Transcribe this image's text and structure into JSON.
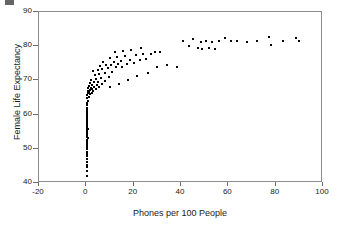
{
  "chart_data": {
    "type": "scatter",
    "title": "",
    "xlabel": "Phones per 100 People",
    "ylabel": "Female Life Expectancy",
    "xlim": [
      -20,
      100
    ],
    "ylim": [
      40,
      90
    ],
    "xticks": [
      -20,
      0,
      20,
      40,
      60,
      80,
      100
    ],
    "yticks": [
      40,
      50,
      60,
      70,
      80,
      90
    ],
    "grid": false,
    "legend": null,
    "marker": "filled-square",
    "marker_color": "#000000",
    "series": [
      {
        "name": "Countries",
        "points": [
          [
            0.2,
            42.0
          ],
          [
            0.3,
            43.5
          ],
          [
            0.2,
            44.6
          ],
          [
            0.4,
            45.4
          ],
          [
            0.2,
            46.2
          ],
          [
            0.3,
            47.0
          ],
          [
            0.2,
            47.8
          ],
          [
            0.4,
            48.5
          ],
          [
            0.2,
            49.2
          ],
          [
            0.3,
            49.9
          ],
          [
            0.2,
            50.5
          ],
          [
            0.4,
            51.1
          ],
          [
            0.2,
            51.7
          ],
          [
            0.3,
            52.2
          ],
          [
            0.2,
            52.7
          ],
          [
            0.5,
            53.1
          ],
          [
            0.2,
            53.5
          ],
          [
            0.3,
            53.9
          ],
          [
            0.2,
            54.2
          ],
          [
            0.4,
            54.5
          ],
          [
            0.2,
            54.8
          ],
          [
            0.3,
            55.1
          ],
          [
            0.2,
            55.4
          ],
          [
            0.5,
            55.7
          ],
          [
            0.2,
            56.0
          ],
          [
            0.3,
            56.4
          ],
          [
            0.2,
            56.8
          ],
          [
            0.4,
            57.2
          ],
          [
            0.2,
            57.6
          ],
          [
            0.3,
            58.1
          ],
          [
            0.2,
            58.6
          ],
          [
            0.4,
            59.1
          ],
          [
            0.2,
            59.6
          ],
          [
            0.3,
            60.2
          ],
          [
            0.2,
            60.8
          ],
          [
            0.4,
            61.4
          ],
          [
            0.2,
            62.0
          ],
          [
            0.3,
            62.7
          ],
          [
            0.2,
            63.4
          ],
          [
            0.5,
            64.1
          ],
          [
            0.3,
            64.8
          ],
          [
            1.0,
            65.2
          ],
          [
            0.4,
            65.6
          ],
          [
            1.6,
            65.9
          ],
          [
            0.6,
            66.2
          ],
          [
            2.2,
            66.4
          ],
          [
            1.1,
            66.6
          ],
          [
            3.0,
            66.8
          ],
          [
            0.5,
            67.0
          ],
          [
            1.7,
            67.2
          ],
          [
            2.6,
            67.4
          ],
          [
            4.0,
            67.5
          ],
          [
            0.8,
            67.7
          ],
          [
            1.9,
            67.9
          ],
          [
            3.3,
            68.1
          ],
          [
            5.2,
            68.2
          ],
          [
            1.2,
            68.4
          ],
          [
            2.4,
            68.6
          ],
          [
            4.4,
            68.8
          ],
          [
            6.5,
            68.9
          ],
          [
            1.5,
            69.2
          ],
          [
            3.1,
            69.4
          ],
          [
            5.0,
            69.6
          ],
          [
            8.0,
            69.8
          ],
          [
            2.0,
            70.2
          ],
          [
            4.2,
            70.5
          ],
          [
            6.2,
            70.8
          ],
          [
            9.5,
            71.0
          ],
          [
            3.6,
            71.5
          ],
          [
            5.5,
            71.8
          ],
          [
            7.8,
            72.2
          ],
          [
            11.0,
            72.5
          ],
          [
            2.8,
            72.8
          ],
          [
            4.8,
            73.1
          ],
          [
            6.8,
            73.4
          ],
          [
            9.0,
            73.6
          ],
          [
            12.5,
            73.8
          ],
          [
            15.0,
            74.0
          ],
          [
            5.8,
            74.2
          ],
          [
            8.4,
            74.4
          ],
          [
            10.5,
            74.6
          ],
          [
            13.5,
            74.8
          ],
          [
            17.0,
            74.9
          ],
          [
            20.0,
            75.1
          ],
          [
            7.2,
            75.3
          ],
          [
            11.8,
            75.5
          ],
          [
            14.5,
            75.7
          ],
          [
            18.5,
            75.9
          ],
          [
            22.5,
            76.1
          ],
          [
            25.0,
            76.3
          ],
          [
            9.8,
            76.5
          ],
          [
            13.0,
            76.8
          ],
          [
            16.5,
            77.0
          ],
          [
            21.0,
            77.3
          ],
          [
            24.0,
            77.6
          ],
          [
            27.5,
            77.8
          ],
          [
            12.0,
            78.2
          ],
          [
            15.5,
            78.6
          ],
          [
            19.0,
            79.0
          ],
          [
            23.0,
            79.4
          ],
          [
            30.0,
            73.9
          ],
          [
            26.0,
            72.3
          ],
          [
            21.5,
            71.2
          ],
          [
            17.5,
            70.0
          ],
          [
            14.0,
            69.0
          ],
          [
            10.0,
            68.0
          ],
          [
            29.0,
            78.2
          ],
          [
            31.0,
            78.3
          ],
          [
            34.0,
            74.6
          ],
          [
            38.5,
            73.9
          ],
          [
            41.0,
            81.5
          ],
          [
            43.5,
            80.0
          ],
          [
            45.0,
            82.0
          ],
          [
            47.0,
            79.6
          ],
          [
            48.5,
            81.2
          ],
          [
            49.0,
            79.2
          ],
          [
            50.5,
            81.6
          ],
          [
            52.0,
            79.4
          ],
          [
            53.0,
            81.3
          ],
          [
            54.5,
            79.3
          ],
          [
            56.0,
            81.5
          ],
          [
            58.5,
            82.3
          ],
          [
            61.0,
            81.4
          ],
          [
            63.5,
            81.6
          ],
          [
            68.0,
            81.3
          ],
          [
            72.0,
            81.6
          ],
          [
            77.0,
            82.8
          ],
          [
            78.0,
            80.4
          ],
          [
            83.0,
            81.5
          ],
          [
            88.5,
            82.3
          ],
          [
            90.0,
            81.4
          ]
        ]
      }
    ]
  },
  "axes": {
    "y_labels": [
      "90",
      "80",
      "70",
      "60",
      "50",
      "40"
    ],
    "x_labels": [
      "-20",
      "0",
      "20",
      "40",
      "60",
      "80",
      "100"
    ]
  }
}
